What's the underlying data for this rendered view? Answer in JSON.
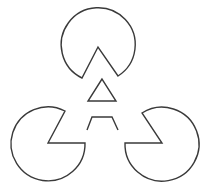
{
  "figure": {
    "title": "",
    "width": 209,
    "height": 187,
    "background": "#ffffff",
    "stroke_color": "#3a3a3a",
    "stroke_width": 1.4
  },
  "pacmen": [
    {
      "name": "top",
      "d": "M 82 78 A 37 37 0 1 1 118 76 L 98 47 Z"
    },
    {
      "name": "left",
      "d": "M 65 111 A 37 37 0 1 0 85 143 L 48 143 Z"
    },
    {
      "name": "right",
      "d": "M 142 113 A 37 37 0 1 1 125 143 L 162 143 Z"
    }
  ],
  "inner_triangle": {
    "points": "102,79 88,101 116,101"
  },
  "trapezoid": {
    "points": "87,130 92,117 112,117 118,130"
  }
}
